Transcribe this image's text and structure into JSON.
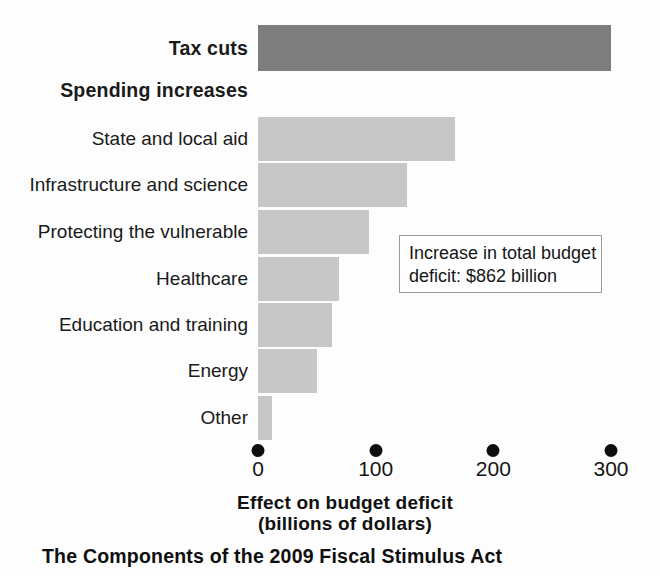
{
  "chart_data": {
    "type": "bar",
    "orientation": "horizontal",
    "title": "The Components of the 2009 Fiscal Stimulus Act",
    "xlabel_line1": "Effect on budget deficit",
    "xlabel_line2": "(billions of dollars)",
    "ylabel": "",
    "xlim": [
      0,
      300
    ],
    "grid": false,
    "legend": "none",
    "categories": [
      "Tax cuts",
      "Spending increases",
      "State and local aid",
      "Infrastructure and science",
      "Protecting the vulnerable",
      "Healthcare",
      "Education and training",
      "Energy",
      "Other"
    ],
    "values": [
      300,
      null,
      167,
      127,
      94,
      69,
      63,
      50,
      12
    ],
    "tick_values": [
      0,
      100,
      200,
      300
    ],
    "tick_labels": [
      "0",
      "100",
      "200",
      "300"
    ],
    "annotation_line1": "Increase in total budget",
    "annotation_line2": "deficit: $862 billion",
    "series": [
      {
        "name": "Tax cuts",
        "color": "#7e7e7e",
        "points": [
          {
            "category": "Tax cuts",
            "value": 300,
            "header": false
          }
        ]
      },
      {
        "name": "Spending increases",
        "color": "#c7c7c7",
        "points": [
          {
            "category": "State and local aid",
            "value": 167,
            "header": false
          },
          {
            "category": "Infrastructure and science",
            "value": 127,
            "header": false
          },
          {
            "category": "Protecting the vulnerable",
            "value": 94,
            "header": false
          },
          {
            "category": "Healthcare",
            "value": 69,
            "header": false
          },
          {
            "category": "Education and training",
            "value": 63,
            "header": false
          },
          {
            "category": "Energy",
            "value": 50,
            "header": false
          },
          {
            "category": "Other",
            "value": 12,
            "header": false
          }
        ]
      }
    ]
  },
  "rows": [
    {
      "label": "Tax cuts",
      "value": 300,
      "bold": true,
      "bar": true,
      "color": "#7e7e7e",
      "top": 25,
      "height": 46
    },
    {
      "label": "Spending increases",
      "value": null,
      "bold": true,
      "bar": false,
      "color": "",
      "top": 78,
      "height": 24
    },
    {
      "label": "State and local aid",
      "value": 167,
      "bold": false,
      "bar": true,
      "color": "#c7c7c7",
      "top": 117,
      "height": 44
    },
    {
      "label": "Infrastructure and science",
      "value": 127,
      "bold": false,
      "bar": true,
      "color": "#c7c7c7",
      "top": 163,
      "height": 44
    },
    {
      "label": "Protecting the vulnerable",
      "value": 94,
      "bold": false,
      "bar": true,
      "color": "#c7c7c7",
      "top": 210,
      "height": 44
    },
    {
      "label": "Healthcare",
      "value": 69,
      "bold": false,
      "bar": true,
      "color": "#c7c7c7",
      "top": 257,
      "height": 44
    },
    {
      "label": "Education and training",
      "value": 63,
      "bold": false,
      "bar": true,
      "color": "#c7c7c7",
      "top": 303,
      "height": 44
    },
    {
      "label": "Energy",
      "value": 50,
      "bold": false,
      "bar": true,
      "color": "#c7c7c7",
      "top": 349,
      "height": 44
    },
    {
      "label": "Other",
      "value": 12,
      "bold": false,
      "bar": true,
      "color": "#c7c7c7",
      "top": 396,
      "height": 44
    }
  ],
  "axis": {
    "origin_x": 258,
    "px_per_unit": 1.1767,
    "dot_y": 444,
    "label_y": 458,
    "ticks": [
      {
        "value": 0,
        "label": "0"
      },
      {
        "value": 100,
        "label": "100"
      },
      {
        "value": 200,
        "label": "200"
      },
      {
        "value": 300,
        "label": "300"
      }
    ],
    "title_line1": "Effect on budget deficit",
    "title_line2": "(billions of dollars)"
  },
  "callout": {
    "line1": "Increase in total budget",
    "line2": "deficit: $862 billion"
  },
  "caption": {
    "text": "The Components of the 2009 Fiscal Stimulus Act"
  }
}
